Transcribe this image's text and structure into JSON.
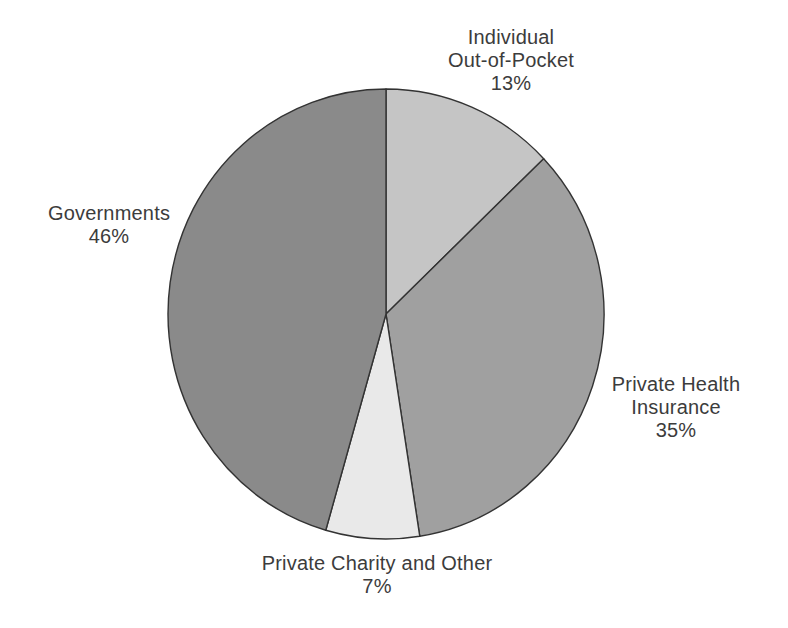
{
  "chart_data": {
    "type": "pie",
    "title": "",
    "unit": "%",
    "legend": "none",
    "direction": "clockwise",
    "start_angle_deg": 0,
    "background_color": "#ffffff",
    "outline_color": "#333333",
    "text_color": "#3c3c3c",
    "categories": [
      "Individual Out-of-Pocket",
      "Private Health Insurance",
      "Private Charity and Other",
      "Governments"
    ],
    "values": [
      13,
      35,
      7,
      46
    ],
    "slices": [
      {
        "label": "Individual Out-of-Pocket",
        "value": 13,
        "percent_label": "13%",
        "color": "#c5c5c5",
        "label_lines": [
          "Individual",
          "Out-of-Pocket",
          "13%"
        ],
        "label_pos": {
          "x": 511,
          "y": 60,
          "align": "center"
        }
      },
      {
        "label": "Private Health Insurance",
        "value": 35,
        "percent_label": "35%",
        "color": "#a0a0a0",
        "label_lines": [
          "Private Health",
          "Insurance",
          "35%"
        ],
        "label_pos": {
          "x": 676,
          "y": 407,
          "align": "center"
        }
      },
      {
        "label": "Private Charity and Other",
        "value": 7,
        "percent_label": "7%",
        "color": "#e9e9e9",
        "label_lines": [
          "Private Charity and Other",
          "7%"
        ],
        "label_pos": {
          "x": 377,
          "y": 575,
          "align": "center"
        }
      },
      {
        "label": "Governments",
        "value": 46,
        "percent_label": "46%",
        "color": "#8a8a8a",
        "label_lines": [
          "Governments",
          "46%"
        ],
        "label_pos": {
          "x": 109,
          "y": 225,
          "align": "center"
        }
      }
    ]
  }
}
